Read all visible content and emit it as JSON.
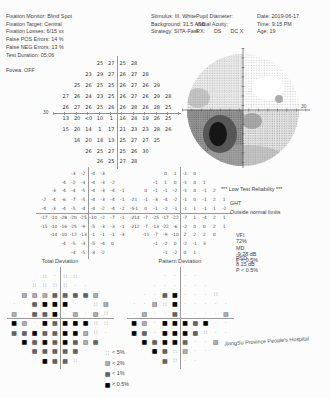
{
  "header": {
    "left": [
      "Fixation Monitor: Blind Spot",
      "Fixation Target: Central",
      "Fixation Losses: 6/15 xx",
      "False POS Errors: 14 %",
      "False NEG Errors: 13 %",
      "Test Duration: 05:06",
      "",
      "Fovea: OFF"
    ],
    "stimulus": [
      "Stimulus: III, White",
      "Background: 31.5 ASB",
      "Strategy: SITA-Fast"
    ],
    "patient": [
      "Pupil Diameter:",
      "Visual Acuity:",
      "RX:      DS      DC X"
    ],
    "right": [
      "Date: 2019-06-17",
      "Time: 9:15 PM",
      "Age: 19"
    ]
  },
  "axes": {
    "threshold_left_label": "30",
    "grayscale_right_label": "30"
  },
  "maps": {
    "threshold": {
      "rows": [
        [
          "25",
          "27",
          "25",
          "28"
        ],
        [
          "23",
          "29",
          "27",
          "26",
          "27",
          "28"
        ],
        [
          "25",
          "26",
          "25",
          "25",
          "26",
          "27",
          "26",
          "29"
        ],
        [
          "27",
          "26",
          "24",
          "23",
          "25",
          "26",
          "27",
          "26",
          "29",
          "28"
        ],
        [
          "26",
          "27",
          "26",
          "25",
          "26",
          "26",
          "28",
          "26",
          "28",
          "25"
        ],
        [
          "13",
          "20",
          "<0",
          "10",
          "1",
          "16",
          "24",
          "19",
          "26",
          "25"
        ],
        [
          "15",
          "20",
          "14",
          "1",
          "17",
          "21",
          "23",
          "23",
          "28",
          "26"
        ],
        [
          "16",
          "20",
          "18",
          "13",
          "25",
          "27",
          "27",
          "25"
        ],
        [
          "26",
          "25",
          "27",
          "25",
          "26",
          "30"
        ],
        [
          "26",
          "25",
          "27",
          "28"
        ]
      ]
    },
    "td_numbers": {
      "rows": [
        [
          "-3",
          "-2",
          "-4",
          "-3"
        ],
        [
          "-4",
          "-2",
          "-3",
          "-4",
          "-3",
          "-2"
        ],
        [
          "-3",
          "-4",
          "-4",
          "-5",
          "-4",
          "-3",
          "-4",
          "-1"
        ],
        [
          "-2",
          "-4",
          "-6",
          "-7",
          "-5",
          "-4",
          "-3",
          "-4",
          "-1",
          "-2"
        ],
        [
          "-4",
          "-3",
          "-4",
          "-5",
          "-4",
          "-4",
          "-2",
          "-4",
          "-2",
          "-5"
        ],
        [
          "-17",
          "-10",
          "-28",
          "-20",
          "-25",
          "-10",
          "-2",
          "-7",
          "-1",
          "-2"
        ],
        [
          "-15",
          "-10",
          "-16",
          "-25",
          "-9",
          "-5",
          "-3",
          "-3",
          "-1",
          "-2"
        ],
        [
          "-14",
          "-10",
          "-12",
          "-13",
          "-1",
          "-1",
          "-1",
          "-3"
        ],
        [
          "-4",
          "-5",
          "-3",
          "-5",
          "-4",
          "0"
        ],
        [
          "-4",
          "-5",
          "-3",
          "-2"
        ]
      ]
    },
    "pd_numbers": {
      "rows": [
        [
          "0",
          "1",
          "-1",
          "0"
        ],
        [
          "-1",
          "1",
          "0",
          "-1",
          "0",
          "1"
        ],
        [
          "0",
          "-1",
          "-1",
          "-2",
          "-1",
          "0",
          "-1",
          "2"
        ],
        [
          "1",
          "-1",
          "-3",
          "-4",
          "-2",
          "-1",
          "0",
          "-1",
          "2",
          "1"
        ],
        [
          "-1",
          "0",
          "-1",
          "-2",
          "-1",
          "-1",
          "1",
          "-1",
          "1",
          "-2"
        ],
        [
          "-14",
          "-7",
          "-25",
          "-17",
          "-22",
          "-7",
          "1",
          "-4",
          "2",
          "1"
        ],
        [
          "-12",
          "-7",
          "-13",
          "-22",
          "-6",
          "-2",
          "0",
          "0",
          "2",
          "1"
        ],
        [
          "-11",
          "-7",
          "-9",
          "-10",
          "2",
          "2",
          "2",
          "0"
        ],
        [
          "-1",
          "-2",
          "0",
          "-2",
          "-1",
          "3"
        ],
        [
          "-1",
          "-2",
          "0",
          "1"
        ]
      ]
    },
    "td_prob": {
      "symbols": true,
      "rows": [
        [
          "5",
          "n",
          "5",
          "5"
        ],
        [
          "5",
          "5",
          "5",
          "5",
          "n",
          "n"
        ],
        [
          "2",
          "2",
          "2",
          "1",
          "1",
          "1",
          "1",
          "2"
        ],
        [
          "n",
          "n",
          "1",
          "0",
          "0",
          "0",
          "n",
          "n",
          "5",
          "2"
        ],
        [
          "2",
          "n",
          "1",
          "1",
          "0",
          "n",
          "2",
          "n",
          "2",
          "5"
        ],
        [
          "0",
          "2",
          "n",
          "0",
          "1",
          "0",
          "0",
          "0",
          "5",
          "5"
        ],
        [
          "1",
          "1",
          "0",
          "1",
          "1",
          "0",
          "0",
          "2",
          "5",
          "n"
        ],
        [
          "0",
          "1",
          "0",
          "1",
          "0",
          "1",
          "2",
          "1"
        ],
        [
          "1",
          "1",
          "1",
          "1",
          "1",
          "n"
        ],
        [
          "0",
          "1",
          "1",
          "5"
        ]
      ]
    },
    "pd_prob": {
      "symbols": true,
      "rows": [
        [
          "n",
          "n",
          "n",
          "n"
        ],
        [
          "n",
          "n",
          "n",
          "n",
          "n",
          "n"
        ],
        [
          "n",
          "n",
          "1",
          "0",
          "n",
          "n",
          "n",
          "5"
        ],
        [
          "n",
          "n",
          "2",
          "5",
          "0",
          "n",
          "n",
          "n",
          "n",
          "n"
        ],
        [
          "n",
          "2",
          "n",
          "n",
          "1",
          "n",
          "n",
          "n",
          "n",
          "2"
        ],
        [
          "0",
          "2",
          "n",
          "0",
          "0",
          "0",
          "1",
          "0",
          "n",
          "n"
        ],
        [
          "0",
          "1",
          "n",
          "0",
          "0",
          "0",
          "1",
          "5",
          "n",
          "n"
        ],
        [
          "0",
          "1",
          "0",
          "0",
          "1",
          "n",
          "n",
          "2"
        ],
        [
          "0",
          "1",
          "5",
          "2",
          "n",
          "n"
        ],
        [
          "1",
          "5",
          "n",
          "n"
        ]
      ]
    }
  },
  "prob_symbols": {
    "n": "·",
    "5": "∷",
    "2": "▨",
    "1": "▩",
    "0": "■"
  },
  "sections": {
    "total_deviation": "Total Deviation",
    "pattern_deviation": "Pattern Deviation"
  },
  "legend": [
    {
      "sym": "5",
      "label": "< 5%"
    },
    {
      "sym": "2",
      "label": "< 2%"
    },
    {
      "sym": "1",
      "label": "< 1%"
    },
    {
      "sym": "0",
      "label": "< 0.5%"
    }
  ],
  "results": {
    "reliability": "*** Low Test Reliability ***",
    "ght_label": "GHT",
    "ght_value": "Outside normal limits",
    "vfi_label": "VFI",
    "vfi_value": "72%",
    "md_label": "MD",
    "md_value": "-9.28 dB",
    "md_p": "P < 0.5%",
    "psd_label": "PSD",
    "psd_value": "8.15 dB",
    "psd_p": "P < 0.5%"
  },
  "footer": "JiangSu Province People's Hospital"
}
